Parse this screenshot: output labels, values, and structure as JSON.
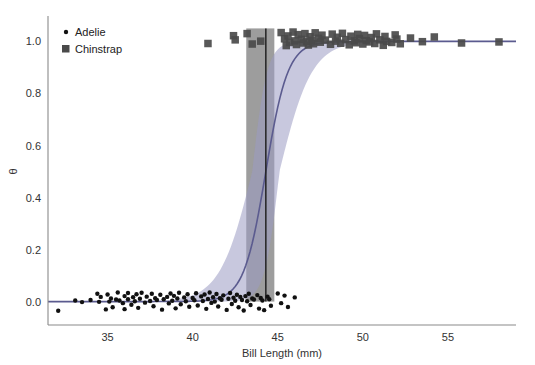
{
  "chart_data": {
    "type": "scatter",
    "title": "",
    "xlabel": "Bill Length (mm)",
    "ylabel": "θ",
    "xlim": [
      31.5,
      59.0
    ],
    "ylim": [
      -0.09,
      1.09
    ],
    "xticks": [
      35,
      40,
      45,
      50,
      55
    ],
    "xtick_labels": [
      "35",
      "40",
      "45",
      "50",
      "55"
    ],
    "yticks": [
      0.0,
      0.2,
      0.4,
      0.6,
      0.8,
      1.0
    ],
    "ytick_labels": [
      "0.0",
      "0.2",
      "0.4",
      "0.6",
      "0.8",
      "1.0"
    ],
    "grid": false,
    "legend_position": "top-left",
    "legend": [
      {
        "name": "Adelie",
        "marker": "circle",
        "color": "#111111",
        "size": 3
      },
      {
        "name": "Chinstrap",
        "marker": "square",
        "color": "#4a4a4a",
        "size": 7
      }
    ],
    "series": [
      {
        "name": "Adelie",
        "marker": "circle",
        "color": "#111111",
        "points": [
          [
            32.1,
            -0.035
          ],
          [
            33.1,
            0.004
          ],
          [
            33.5,
            -0.002
          ],
          [
            34.0,
            0.006
          ],
          [
            34.4,
            0.03
          ],
          [
            34.5,
            -0.001
          ],
          [
            34.6,
            0.018
          ],
          [
            34.9,
            -0.03
          ],
          [
            35.0,
            0.027
          ],
          [
            35.1,
            0.0
          ],
          [
            35.2,
            0.012
          ],
          [
            35.3,
            -0.022
          ],
          [
            35.5,
            0.008
          ],
          [
            35.6,
            0.035
          ],
          [
            35.7,
            0.004
          ],
          [
            35.9,
            -0.006
          ],
          [
            36.0,
            0.021
          ],
          [
            36.0,
            -0.029
          ],
          [
            36.2,
            0.009
          ],
          [
            36.2,
            0.033
          ],
          [
            36.4,
            -0.012
          ],
          [
            36.5,
            0.017
          ],
          [
            36.6,
            0.001
          ],
          [
            36.7,
            0.028
          ],
          [
            36.8,
            -0.024
          ],
          [
            36.9,
            0.011
          ],
          [
            37.0,
            0.034
          ],
          [
            37.2,
            -0.004
          ],
          [
            37.3,
            0.019
          ],
          [
            37.5,
            0.002
          ],
          [
            37.6,
            0.03
          ],
          [
            37.7,
            -0.018
          ],
          [
            37.8,
            0.013
          ],
          [
            37.9,
            0.006
          ],
          [
            38.1,
            0.026
          ],
          [
            38.2,
            -0.031
          ],
          [
            38.3,
            0.009
          ],
          [
            38.5,
            0.018
          ],
          [
            38.6,
            -0.007
          ],
          [
            38.7,
            0.031
          ],
          [
            38.8,
            0.003
          ],
          [
            38.9,
            0.022
          ],
          [
            39.0,
            -0.026
          ],
          [
            39.1,
            0.012
          ],
          [
            39.2,
            0.034
          ],
          [
            39.3,
            -0.01
          ],
          [
            39.5,
            0.016
          ],
          [
            39.6,
            0.001
          ],
          [
            39.7,
            0.028
          ],
          [
            39.8,
            -0.02
          ],
          [
            40.0,
            0.014
          ],
          [
            40.1,
            0.005
          ],
          [
            40.2,
            0.032
          ],
          [
            40.3,
            -0.015
          ],
          [
            40.5,
            0.02
          ],
          [
            40.6,
            0.002
          ],
          [
            40.7,
            0.027
          ],
          [
            40.8,
            -0.028
          ],
          [
            40.9,
            0.01
          ],
          [
            41.0,
            0.035
          ],
          [
            41.1,
            -0.005
          ],
          [
            41.2,
            0.017
          ],
          [
            41.3,
            0.0
          ],
          [
            41.4,
            0.029
          ],
          [
            41.5,
            -0.019
          ],
          [
            41.6,
            0.013
          ],
          [
            41.7,
            0.007
          ],
          [
            41.8,
            0.024
          ],
          [
            42.0,
            -0.032
          ],
          [
            42.1,
            0.011
          ],
          [
            42.2,
            0.033
          ],
          [
            42.3,
            -0.009
          ],
          [
            42.4,
            0.015
          ],
          [
            42.5,
            0.003
          ],
          [
            42.6,
            0.026
          ],
          [
            42.7,
            -0.022
          ],
          [
            42.8,
            0.018
          ],
          [
            42.9,
            0.006
          ],
          [
            43.0,
            -0.034
          ],
          [
            43.1,
            0.021
          ],
          [
            43.2,
            0.001
          ],
          [
            43.3,
            0.03
          ],
          [
            43.4,
            -0.013
          ],
          [
            43.5,
            0.012
          ],
          [
            43.6,
            0.008
          ],
          [
            43.8,
            0.025
          ],
          [
            43.9,
            -0.027
          ],
          [
            44.0,
            0.014
          ],
          [
            44.1,
            0.004
          ],
          [
            44.2,
            -0.033
          ],
          [
            44.4,
            0.019
          ],
          [
            44.5,
            0.009
          ],
          [
            44.6,
            -0.016
          ],
          [
            45.0,
            0.031
          ],
          [
            45.2,
            -0.006
          ],
          [
            45.4,
            0.023
          ],
          [
            45.6,
            -0.021
          ],
          [
            46.0,
            0.016
          ]
        ]
      },
      {
        "name": "Chinstrap",
        "marker": "square",
        "color": "#4a4a4a",
        "points": [
          [
            40.9,
            0.992
          ],
          [
            42.4,
            1.022
          ],
          [
            42.5,
            1.006
          ],
          [
            43.2,
            1.03
          ],
          [
            43.5,
            0.99
          ],
          [
            44.0,
            1.001
          ],
          [
            45.2,
            1.034
          ],
          [
            45.4,
            1.01
          ],
          [
            45.5,
            0.984
          ],
          [
            45.6,
            1.021
          ],
          [
            45.7,
            0.996
          ],
          [
            45.9,
            1.036
          ],
          [
            46.0,
            1.002
          ],
          [
            46.1,
            0.988
          ],
          [
            46.2,
            1.026
          ],
          [
            46.4,
            1.008
          ],
          [
            46.5,
            0.994
          ],
          [
            46.6,
            1.03
          ],
          [
            46.7,
            1.0
          ],
          [
            46.8,
            0.986
          ],
          [
            46.9,
            1.018
          ],
          [
            47.0,
            1.004
          ],
          [
            47.1,
            0.991
          ],
          [
            47.2,
            1.033
          ],
          [
            47.4,
            1.012
          ],
          [
            47.5,
            0.997
          ],
          [
            47.6,
            1.024
          ],
          [
            47.8,
            1.005
          ],
          [
            48.1,
            0.989
          ],
          [
            48.2,
            1.028
          ],
          [
            48.4,
            1.001
          ],
          [
            48.5,
            1.016
          ],
          [
            48.7,
            0.993
          ],
          [
            48.8,
            1.031
          ],
          [
            49.0,
            1.007
          ],
          [
            49.2,
            0.987
          ],
          [
            49.3,
            1.02
          ],
          [
            49.5,
            1.002
          ],
          [
            49.6,
            0.995
          ],
          [
            49.7,
            1.027
          ],
          [
            49.8,
            1.011
          ],
          [
            50.0,
            0.99
          ],
          [
            50.1,
            1.023
          ],
          [
            50.2,
            1.003
          ],
          [
            50.4,
            0.998
          ],
          [
            50.5,
            1.015
          ],
          [
            50.7,
            0.992
          ],
          [
            50.8,
            1.029
          ],
          [
            51.0,
            1.006
          ],
          [
            51.2,
            0.985
          ],
          [
            51.3,
            1.019
          ],
          [
            51.4,
            1.0
          ],
          [
            51.7,
            0.996
          ],
          [
            51.9,
            1.025
          ],
          [
            52.0,
            1.009
          ],
          [
            52.2,
            0.991
          ],
          [
            52.8,
            1.013
          ],
          [
            53.5,
            0.999
          ],
          [
            54.2,
            1.017
          ],
          [
            55.8,
            0.994
          ],
          [
            58.0,
            0.998
          ]
        ]
      }
    ],
    "fit_curve": {
      "name": "logistic-mean",
      "color": "#5b5b8f",
      "x0": 44.3,
      "slope": 1.55,
      "ymin": 0.0,
      "ymax": 1.0
    },
    "credible_band": {
      "name": "logistic-credible-interval",
      "color": "#9b9bc3",
      "opacity": 0.55,
      "x0_low": 43.5,
      "x0_high": 45.1,
      "slope_low": 1.05,
      "slope_high": 2.3
    },
    "threshold_band": {
      "name": "threshold-credible-interval",
      "color": "#8c8c8c",
      "opacity": 0.85,
      "x_low": 43.15,
      "x_high": 44.8,
      "x_center": 44.3,
      "line_color": "#222222"
    }
  }
}
